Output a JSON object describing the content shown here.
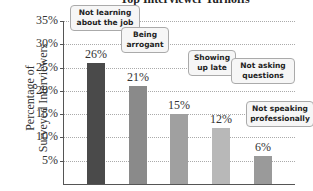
{
  "chart_data": {
    "type": "bar",
    "title": "Top Interviewer Turnoffs",
    "xlabel": "",
    "ylabel": "Percentage of Surveyed Interviewers",
    "categories": [
      "Not learning about the job",
      "Being arrogant",
      "Showing up late",
      "Not asking questions",
      "Not speaking professionally"
    ],
    "values": [
      26,
      21,
      15,
      12,
      6
    ],
    "value_labels": [
      "26%",
      "21%",
      "15%",
      "12%",
      "6%"
    ],
    "ylim": [
      0,
      35
    ],
    "yticks": [
      "5%",
      "10%",
      "15%",
      "20%",
      "25%",
      "30%",
      "35%"
    ],
    "grid": true,
    "bar_colors": [
      "#4a4a4a",
      "#8a8a8a",
      "#a0a0a0",
      "#b8b8b8",
      "#9a9a9a"
    ]
  },
  "ylabel_line1": "Percentage of",
  "ylabel_line2": "Surveyed Interviewers"
}
